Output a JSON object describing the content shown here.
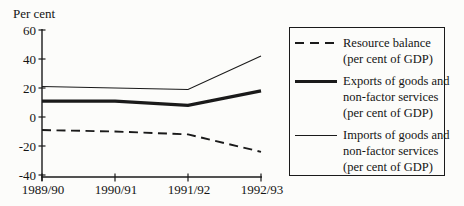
{
  "chart_data": {
    "type": "line",
    "title": "",
    "ylabel": "Per cent",
    "xlabel": "",
    "categories": [
      "1989/90",
      "1990/91",
      "1991/92",
      "1992/93"
    ],
    "yticks": [
      60,
      40,
      20,
      0,
      -20,
      -40
    ],
    "ylim": [
      -40,
      60
    ],
    "grid": false,
    "legend_position": "right",
    "series": [
      {
        "name": "Resource balance (per cent of GDP)",
        "style": "dashed",
        "width": 1.9,
        "values": [
          -9,
          -10,
          -12,
          -24
        ]
      },
      {
        "name": "Exports of goods and non-factor services (per cent of GDP)",
        "style": "solid-thick",
        "width": 3.3,
        "values": [
          11,
          11,
          8,
          18
        ]
      },
      {
        "name": "Imports of goods and non-factor services (per cent of GDP)",
        "style": "solid-thin",
        "width": 1.1,
        "values": [
          21,
          20,
          19,
          42
        ]
      }
    ]
  },
  "legend": {
    "items": [
      {
        "sample": "dashed",
        "lines": [
          "Resource balance",
          "(per cent of GDP)"
        ]
      },
      {
        "sample": "solid-thick",
        "lines": [
          "Exports of goods and",
          "non-factor services",
          "(per cent of GDP)"
        ]
      },
      {
        "sample": "solid-thin",
        "lines": [
          "Imports of goods and",
          "non-factor services",
          "(per cent of GDP)"
        ]
      }
    ]
  },
  "colors": {
    "ink": "#1a1a1a",
    "text": "#141414",
    "background": "#fcfcfa"
  }
}
